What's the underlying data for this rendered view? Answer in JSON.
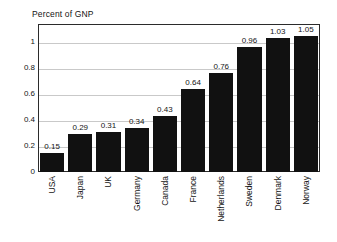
{
  "chart_data": {
    "type": "bar",
    "title": "Percent of GNP",
    "xlabel": "",
    "ylabel": "",
    "categories": [
      "USA",
      "Japan",
      "UK",
      "Germany",
      "Canada",
      "France",
      "Netherlands",
      "Sweden",
      "Denmark",
      "Norway"
    ],
    "values": [
      0.15,
      0.29,
      0.31,
      0.34,
      0.43,
      0.64,
      0.76,
      0.96,
      1.03,
      1.05
    ],
    "value_labels": [
      "0.15",
      "0.29",
      "0.31",
      "0.34",
      "0.43",
      "0.64",
      "0.76",
      "0.96",
      "1.03",
      "1.05"
    ],
    "ylim": [
      0,
      1.14
    ],
    "yticks": [
      1,
      0.8,
      0.6,
      0.4,
      0.2,
      0
    ],
    "ytick_labels": [
      "1",
      "0.8",
      "0.6",
      "0.4",
      "0.2",
      "0"
    ],
    "grid": true,
    "legend": null,
    "bar_color": "#111111",
    "grid_color": "#c9c9c9",
    "frame_color": "#2b2b2b",
    "text_color": "#141414",
    "background": "#ffffff"
  }
}
